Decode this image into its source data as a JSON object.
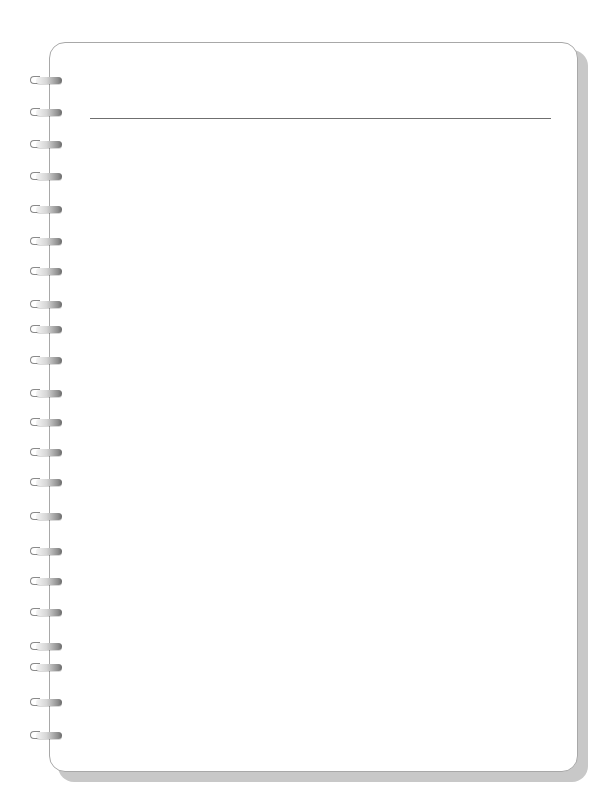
{
  "notebook": {
    "title": "",
    "header_line_color": "#6f6f6f",
    "border_color": "#a8a8a8",
    "shadow_color": "#c8c8c8",
    "ring_count": 22,
    "rings_y": [
      80,
      112,
      144,
      176,
      209,
      241,
      271,
      304,
      329,
      360,
      393,
      422,
      452,
      482,
      516,
      551,
      581,
      612,
      646,
      667,
      702,
      735
    ]
  }
}
